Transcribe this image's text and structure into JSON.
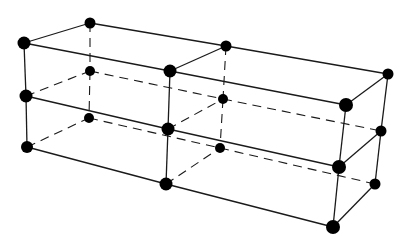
{
  "diagram": {
    "type": "lattice-wireframe",
    "colors": {
      "edge": "#1a1a1a",
      "node": "#000000",
      "background": "#ffffff"
    },
    "nodes": [
      {
        "id": "FL0",
        "x": 24,
        "y": 43,
        "r": 6.5
      },
      {
        "id": "FL1",
        "x": 26,
        "y": 96,
        "r": 6.5
      },
      {
        "id": "FL2",
        "x": 27,
        "y": 147,
        "r": 6
      },
      {
        "id": "BL0",
        "x": 90,
        "y": 23,
        "r": 5.5
      },
      {
        "id": "BL1",
        "x": 90,
        "y": 71,
        "r": 5
      },
      {
        "id": "BL2",
        "x": 89,
        "y": 118,
        "r": 5
      },
      {
        "id": "FM0",
        "x": 170,
        "y": 71,
        "r": 6.5
      },
      {
        "id": "FM1",
        "x": 168,
        "y": 129,
        "r": 6.5
      },
      {
        "id": "FM2",
        "x": 166,
        "y": 184,
        "r": 6.5
      },
      {
        "id": "BM0",
        "x": 226,
        "y": 46,
        "r": 5.5
      },
      {
        "id": "BM1",
        "x": 223,
        "y": 99,
        "r": 5
      },
      {
        "id": "BM2",
        "x": 220,
        "y": 148,
        "r": 5
      },
      {
        "id": "FR0",
        "x": 346,
        "y": 105,
        "r": 7
      },
      {
        "id": "FR1",
        "x": 339,
        "y": 167,
        "r": 7
      },
      {
        "id": "FR2",
        "x": 333,
        "y": 227,
        "r": 7
      },
      {
        "id": "BR0",
        "x": 388,
        "y": 74,
        "r": 5.5
      },
      {
        "id": "BR1",
        "x": 381,
        "y": 131,
        "r": 5.5
      },
      {
        "id": "BR2",
        "x": 375,
        "y": 184,
        "r": 5.5
      }
    ],
    "edges": [
      {
        "from": "FL0",
        "to": "FL1",
        "style": "solid"
      },
      {
        "from": "FL1",
        "to": "FL2",
        "style": "solid"
      },
      {
        "from": "FM0",
        "to": "FM1",
        "style": "solid"
      },
      {
        "from": "FM1",
        "to": "FM2",
        "style": "solid"
      },
      {
        "from": "FR0",
        "to": "FR1",
        "style": "solid"
      },
      {
        "from": "FR1",
        "to": "FR2",
        "style": "solid"
      },
      {
        "from": "BR0",
        "to": "BR1",
        "style": "solid"
      },
      {
        "from": "BR1",
        "to": "BR2",
        "style": "solid"
      },
      {
        "from": "FL0",
        "to": "FM0",
        "style": "solid"
      },
      {
        "from": "FM0",
        "to": "FR0",
        "style": "solid"
      },
      {
        "from": "FL1",
        "to": "FM1",
        "style": "solid"
      },
      {
        "from": "FM1",
        "to": "FR1",
        "style": "solid"
      },
      {
        "from": "FL2",
        "to": "FM2",
        "style": "solid"
      },
      {
        "from": "FM2",
        "to": "FR2",
        "style": "solid"
      },
      {
        "from": "BL0",
        "to": "BM0",
        "style": "solid"
      },
      {
        "from": "BM0",
        "to": "BR0",
        "style": "solid"
      },
      {
        "from": "FL0",
        "to": "BL0",
        "style": "solid"
      },
      {
        "from": "FM0",
        "to": "BM0",
        "style": "solid"
      },
      {
        "from": "FR0",
        "to": "BR0",
        "style": "solid"
      },
      {
        "from": "FR1",
        "to": "BR1",
        "style": "solid"
      },
      {
        "from": "FR2",
        "to": "BR2",
        "style": "solid"
      },
      {
        "from": "BL0",
        "to": "BL1",
        "style": "dashed"
      },
      {
        "from": "BL1",
        "to": "BL2",
        "style": "dashed"
      },
      {
        "from": "BM0",
        "to": "BM1",
        "style": "dashed"
      },
      {
        "from": "BM1",
        "to": "BM2",
        "style": "dashed"
      },
      {
        "from": "BL1",
        "to": "BM1",
        "style": "dashed"
      },
      {
        "from": "BM1",
        "to": "BR1",
        "style": "dashed"
      },
      {
        "from": "BL2",
        "to": "BM2",
        "style": "dashed"
      },
      {
        "from": "BM2",
        "to": "BR2",
        "style": "dashed"
      },
      {
        "from": "FL1",
        "to": "BL1",
        "style": "dashed"
      },
      {
        "from": "FL2",
        "to": "BL2",
        "style": "dashed"
      },
      {
        "from": "FM1",
        "to": "BM1",
        "style": "dashed"
      },
      {
        "from": "FM2",
        "to": "BM2",
        "style": "dashed"
      }
    ]
  }
}
